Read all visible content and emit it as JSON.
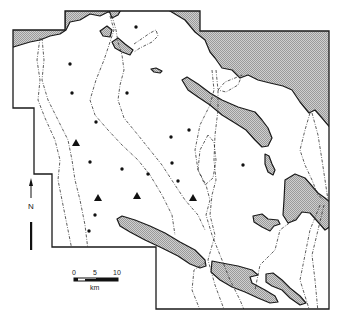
{
  "map": {
    "type": "survey area map",
    "legend": {
      "north_label": "N",
      "scale_ticks": [
        "0",
        "5",
        "10"
      ],
      "scale_unit": "km"
    },
    "colors": {
      "water_fill": "#bdbdbd",
      "line": "#1a1a1a",
      "background": "#ffffff"
    },
    "features": {
      "dots": [
        [
          136,
          27
        ],
        [
          70,
          64
        ],
        [
          72,
          93
        ],
        [
          127,
          93
        ],
        [
          96,
          122
        ],
        [
          171,
          137
        ],
        [
          189,
          130
        ],
        [
          90,
          162
        ],
        [
          122,
          169
        ],
        [
          148,
          174
        ],
        [
          172,
          163
        ],
        [
          178,
          181
        ],
        [
          243,
          165
        ],
        [
          95,
          215
        ],
        [
          89,
          231
        ]
      ],
      "triangles": [
        [
          76,
          143
        ],
        [
          98,
          198
        ],
        [
          137,
          196
        ],
        [
          193,
          198
        ]
      ]
    }
  }
}
